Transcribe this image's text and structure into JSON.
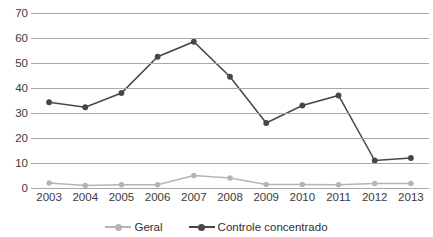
{
  "chart_data": {
    "type": "line",
    "title": "",
    "xlabel": "",
    "ylabel": "",
    "categories": [
      "2003",
      "2004",
      "2005",
      "2006",
      "2007",
      "2008",
      "2009",
      "2010",
      "2011",
      "2012",
      "2013"
    ],
    "yticks": [
      0,
      10,
      20,
      30,
      40,
      50,
      60,
      70
    ],
    "ylim": [
      0,
      70
    ],
    "grid": true,
    "legend_position": "bottom",
    "series": [
      {
        "name": "Geral",
        "color": "#b4b4b4",
        "values": [
          2.0,
          1.0,
          1.3,
          1.3,
          5.0,
          4.0,
          1.4,
          1.4,
          1.3,
          1.8,
          1.8
        ]
      },
      {
        "name": "Controle concentrado",
        "color": "#474747",
        "values": [
          34.3,
          32.3,
          38.0,
          52.5,
          58.5,
          44.5,
          26.0,
          33.0,
          37.0,
          11.0,
          12.0
        ]
      }
    ]
  },
  "legend": {
    "items": [
      {
        "label": "Geral",
        "icon": "line-marker-icon"
      },
      {
        "label": "Controle concentrado",
        "icon": "line-marker-icon"
      }
    ]
  },
  "colors": {
    "gridline": "#a8a8a8",
    "axis_text": "#3a3a3a",
    "series_light": "#b4b4b4",
    "series_dark": "#474747",
    "background": "#ffffff"
  }
}
